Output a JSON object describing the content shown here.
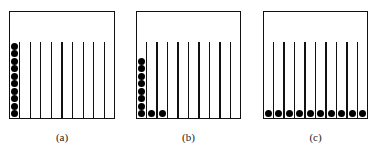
{
  "figure": {
    "panels": [
      {
        "id": "a",
        "label": "(a)",
        "box": {
          "x": 9,
          "y": 11,
          "w": 106,
          "h": 108
        },
        "columns": 10,
        "counts": [
          10,
          0,
          0,
          0,
          0,
          0,
          0,
          0,
          0,
          0
        ]
      },
      {
        "id": "b",
        "label": "(b)",
        "box": {
          "x": 136,
          "y": 11,
          "w": 105,
          "h": 108
        },
        "columns": 10,
        "counts": [
          8,
          1,
          1,
          0,
          0,
          0,
          0,
          0,
          0,
          0
        ]
      },
      {
        "id": "c",
        "label": "(c)",
        "box": {
          "x": 263,
          "y": 11,
          "w": 105,
          "h": 108
        },
        "columns": 10,
        "counts": [
          1,
          1,
          1,
          1,
          1,
          1,
          1,
          1,
          1,
          1
        ]
      }
    ],
    "line_top_offset": 31,
    "dot_diameter": 7,
    "colors": {
      "stroke": "#111111",
      "dot": "#000000",
      "background": "#ffffff"
    }
  }
}
